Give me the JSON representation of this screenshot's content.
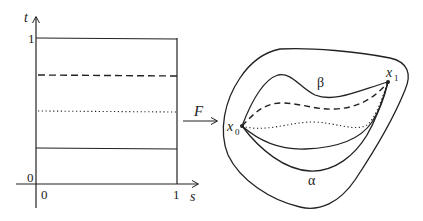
{
  "figure": {
    "left_panel": {
      "axis_t_label": "t",
      "axis_s_label": "s",
      "t_tick_1": "1",
      "t_tick_0": "0",
      "s_tick_0": "0",
      "s_tick_1": "1",
      "horizontal_lines": [
        {
          "t": 1.0,
          "style": "solid"
        },
        {
          "t": 0.75,
          "style": "dashed"
        },
        {
          "t": 0.5,
          "style": "dotted"
        },
        {
          "t": 0.25,
          "style": "solid"
        }
      ]
    },
    "map": {
      "label": "F"
    },
    "right_panel": {
      "start_point_label": "x",
      "start_point_sub": "0",
      "end_point_label": "x",
      "end_point_sub": "1",
      "upper_path_label": "β",
      "lower_path_label": "α"
    },
    "colors": {
      "stroke": "#222222",
      "background": "#ffffff"
    }
  }
}
